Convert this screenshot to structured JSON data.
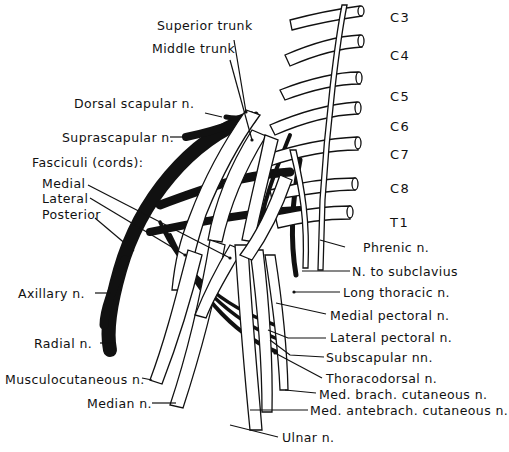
{
  "figure": {
    "type": "anatomical-line-drawing"
  },
  "segments": [
    {
      "id": "c3",
      "label": "C3"
    },
    {
      "id": "c4",
      "label": "C4"
    },
    {
      "id": "c5",
      "label": "C5"
    },
    {
      "id": "c6",
      "label": "C6"
    },
    {
      "id": "c7",
      "label": "C7"
    },
    {
      "id": "c8",
      "label": "C8"
    },
    {
      "id": "t1",
      "label": "T1"
    }
  ],
  "labels": {
    "superior_trunk": "Superior trunk",
    "middle_trunk": "Middle trunk",
    "dorsal_scapular": "Dorsal scapular n.",
    "suprascapular": "Suprascapular n.",
    "fasciculi": "Fasciculi (cords):",
    "medial": "Medial",
    "lateral": "Lateral",
    "posterior": "Posterior",
    "axillary": "Axillary n.",
    "radial": "Radial n.",
    "musculocutaneous": "Musculocutaneous n.",
    "median": "Median n.",
    "phrenic": "Phrenic n.",
    "n_to_subclavius": "N. to subclavius",
    "long_thoracic": "Long thoracic n.",
    "medial_pectoral": "Medial pectoral n.",
    "lateral_pectoral": "Lateral pectoral n.",
    "subscapular": "Subscapular nn.",
    "thoracodorsal": "Thoracodorsal n.",
    "med_brach_cutaneous": "Med. brach. cutaneous n.",
    "med_antebrach_cutaneous": "Med. antebrach. cutaneous n.",
    "ulnar": "Ulnar n."
  },
  "colors": {
    "ink": "#111111",
    "background": "#ffffff"
  }
}
